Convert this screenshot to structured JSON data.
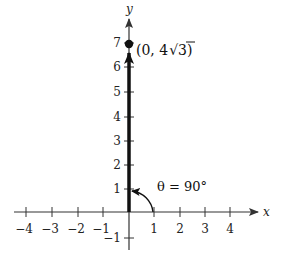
{
  "figure": {
    "type": "coordinate-diagram",
    "axes": {
      "x_label": "x",
      "y_label": "y",
      "x_ticks": [
        -4,
        -3,
        -2,
        -1,
        1,
        2,
        3,
        4
      ],
      "y_ticks": [
        -1,
        1,
        2,
        3,
        4,
        5,
        6,
        7
      ],
      "x_tick_labels": [
        "−4",
        "−3",
        "−2",
        "−1",
        "1",
        "2",
        "3",
        "4"
      ],
      "y_tick_labels": [
        "−1",
        "1",
        "2",
        "3",
        "4",
        "5",
        "6",
        "7"
      ]
    },
    "vector": {
      "from": [
        0,
        0
      ],
      "to": [
        0,
        6.928
      ],
      "style": "bold-arrow"
    },
    "point": {
      "label_prefix": "(0, 4",
      "label_radical": "3",
      "label_suffix": ")",
      "coords": [
        0,
        6.928
      ]
    },
    "angle": {
      "label": "θ = 90°",
      "degrees": 90
    },
    "colors": {
      "ink": "#111111",
      "axis": "#333333",
      "background": "#ffffff"
    }
  }
}
